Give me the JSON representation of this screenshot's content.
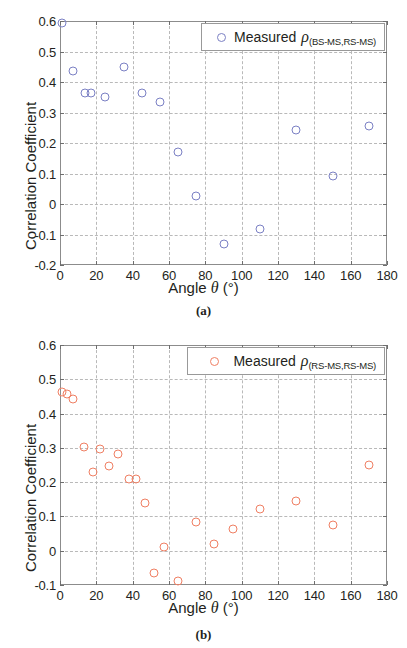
{
  "figure": {
    "panels": [
      "a",
      "b"
    ]
  },
  "chart_data": [
    {
      "type": "scatter",
      "panel_label": "(a)",
      "title": "",
      "xlabel": "Angle θ (°)",
      "ylabel": "Correlation Coefficient",
      "xlim": [
        0,
        180
      ],
      "ylim": [
        -0.2,
        0.6
      ],
      "xticks": [
        0,
        20,
        40,
        60,
        80,
        100,
        120,
        140,
        160,
        180
      ],
      "xticklabels": [
        "0",
        "20",
        "40",
        "60",
        "80",
        "100",
        "120",
        "140",
        "160",
        "180"
      ],
      "yticks": [
        -0.2,
        -0.1,
        0,
        0.1,
        0.2,
        0.3,
        0.4,
        0.5,
        0.6
      ],
      "yticklabels": [
        "-0.2",
        "-0.1",
        "0",
        "0.1",
        "0.2",
        "0.3",
        "0.4",
        "0.5",
        "0.6"
      ],
      "grid": true,
      "legend": {
        "position": "top-right",
        "entries": [
          {
            "marker": "open-circle",
            "color": "#7b80c4",
            "prefix": "Measured",
            "symbol": "ρ",
            "subscript": "(BS-MS,RS-MS)"
          }
        ]
      },
      "series": [
        {
          "name": "Measured ρ (BS-MS,RS-MS)",
          "color": "#7b80c4",
          "marker": "open-circle",
          "points": [
            {
              "x": 1,
              "y": 0.595
            },
            {
              "x": 7,
              "y": 0.435
            },
            {
              "x": 14,
              "y": 0.365
            },
            {
              "x": 17,
              "y": 0.365
            },
            {
              "x": 25,
              "y": 0.35
            },
            {
              "x": 35,
              "y": 0.448
            },
            {
              "x": 45,
              "y": 0.363
            },
            {
              "x": 55,
              "y": 0.335
            },
            {
              "x": 65,
              "y": 0.172
            },
            {
              "x": 75,
              "y": 0.027
            },
            {
              "x": 90,
              "y": -0.131
            },
            {
              "x": 110,
              "y": -0.083
            },
            {
              "x": 130,
              "y": 0.243
            },
            {
              "x": 150,
              "y": 0.092
            },
            {
              "x": 170,
              "y": 0.255
            }
          ]
        }
      ]
    },
    {
      "type": "scatter",
      "panel_label": "(b)",
      "title": "",
      "xlabel": "Angle θ (°)",
      "ylabel": "Correlation Coefficient",
      "xlim": [
        0,
        180
      ],
      "ylim": [
        -0.1,
        0.6
      ],
      "xticks": [
        0,
        20,
        40,
        60,
        80,
        100,
        120,
        140,
        160,
        180
      ],
      "xticklabels": [
        "0",
        "20",
        "40",
        "60",
        "80",
        "100",
        "120",
        "140",
        "160",
        "180"
      ],
      "yticks": [
        -0.1,
        0,
        0.1,
        0.2,
        0.3,
        0.4,
        0.5,
        0.6
      ],
      "yticklabels": [
        "-0.1",
        "0",
        "0.1",
        "0.2",
        "0.3",
        "0.4",
        "0.5",
        "0.6"
      ],
      "grid": true,
      "legend": {
        "position": "top-right",
        "entries": [
          {
            "marker": "open-circle",
            "color": "#ef7f63",
            "prefix": "Measured",
            "symbol": "ρ",
            "subscript": "(RS-MS,RS-MS)"
          }
        ]
      },
      "series": [
        {
          "name": "Measured ρ (RS-MS,RS-MS)",
          "color": "#ef7f63",
          "marker": "open-circle",
          "points": [
            {
              "x": 1,
              "y": 0.462
            },
            {
              "x": 4,
              "y": 0.457
            },
            {
              "x": 7,
              "y": 0.442
            },
            {
              "x": 13,
              "y": 0.303
            },
            {
              "x": 18,
              "y": 0.231
            },
            {
              "x": 22,
              "y": 0.297
            },
            {
              "x": 27,
              "y": 0.248
            },
            {
              "x": 32,
              "y": 0.282
            },
            {
              "x": 38,
              "y": 0.209
            },
            {
              "x": 42,
              "y": 0.209
            },
            {
              "x": 47,
              "y": 0.138
            },
            {
              "x": 52,
              "y": -0.064
            },
            {
              "x": 57,
              "y": 0.012
            },
            {
              "x": 65,
              "y": -0.089
            },
            {
              "x": 75,
              "y": 0.083
            },
            {
              "x": 85,
              "y": 0.019
            },
            {
              "x": 95,
              "y": 0.063
            },
            {
              "x": 110,
              "y": 0.123
            },
            {
              "x": 130,
              "y": 0.144
            },
            {
              "x": 150,
              "y": 0.076
            },
            {
              "x": 170,
              "y": 0.251
            }
          ]
        }
      ]
    }
  ]
}
